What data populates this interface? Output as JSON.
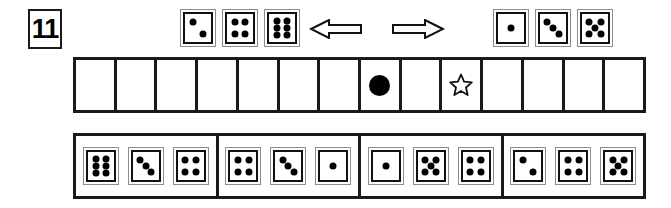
{
  "problem": {
    "number": "11"
  },
  "rule_row": {
    "name": "dice-rule-legend",
    "left_dice": [
      {
        "name": "rule-die-left-1",
        "value": 2
      },
      {
        "name": "rule-die-left-2",
        "value": 4
      },
      {
        "name": "rule-die-left-3",
        "value": 6
      }
    ],
    "left_arrow": {
      "name": "left-arrow-icon",
      "direction": "left"
    },
    "right_arrow": {
      "name": "right-arrow-icon",
      "direction": "right"
    },
    "right_dice": [
      {
        "name": "rule-die-right-1",
        "value": 1
      },
      {
        "name": "rule-die-right-2",
        "value": 3
      },
      {
        "name": "rule-die-right-3",
        "value": 5
      }
    ]
  },
  "track": {
    "name": "game-track",
    "cell_count": 14,
    "cells": [
      {
        "index": 1,
        "marker": ""
      },
      {
        "index": 2,
        "marker": ""
      },
      {
        "index": 3,
        "marker": ""
      },
      {
        "index": 4,
        "marker": ""
      },
      {
        "index": 5,
        "marker": ""
      },
      {
        "index": 6,
        "marker": ""
      },
      {
        "index": 7,
        "marker": ""
      },
      {
        "index": 8,
        "marker": "dot"
      },
      {
        "index": 9,
        "marker": ""
      },
      {
        "index": 10,
        "marker": "star"
      },
      {
        "index": 11,
        "marker": ""
      },
      {
        "index": 12,
        "marker": ""
      },
      {
        "index": 13,
        "marker": ""
      },
      {
        "index": 14,
        "marker": ""
      }
    ]
  },
  "answer_row": {
    "name": "answer-choices",
    "groups": [
      {
        "name": "answer-group-a",
        "dice": [
          6,
          3,
          4
        ]
      },
      {
        "name": "answer-group-b",
        "dice": [
          4,
          3,
          1
        ]
      },
      {
        "name": "answer-group-c",
        "dice": [
          1,
          5,
          4
        ]
      },
      {
        "name": "answer-group-d",
        "dice": [
          2,
          4,
          5
        ]
      }
    ]
  },
  "colors": {
    "ink": "#1a1a1a",
    "pip": "#000000",
    "die_border": "#8c8c8c",
    "background": "#ffffff"
  },
  "pip_layouts": {
    "1": [
      [
        50,
        50
      ]
    ],
    "2": [
      [
        30,
        28
      ],
      [
        70,
        72
      ]
    ],
    "3": [
      [
        28,
        28
      ],
      [
        50,
        50
      ],
      [
        72,
        72
      ]
    ],
    "4": [
      [
        29,
        28
      ],
      [
        71,
        28
      ],
      [
        29,
        72
      ],
      [
        71,
        72
      ]
    ],
    "5": [
      [
        28,
        27
      ],
      [
        72,
        27
      ],
      [
        50,
        50
      ],
      [
        28,
        73
      ],
      [
        72,
        73
      ]
    ],
    "6": [
      [
        30,
        24
      ],
      [
        70,
        24
      ],
      [
        30,
        50
      ],
      [
        70,
        50
      ],
      [
        30,
        76
      ],
      [
        70,
        76
      ]
    ]
  },
  "layout": {
    "top_die_positions": [
      180,
      222,
      264,
      493,
      535,
      577
    ],
    "left_arrow_x": 309,
    "right_arrow_x": 391
  }
}
